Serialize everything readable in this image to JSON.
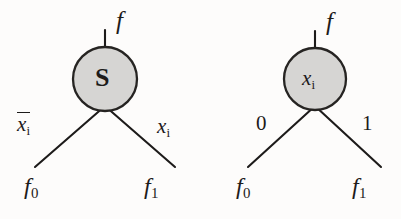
{
  "figure": {
    "background_color": "#fdfcfb",
    "ink_color": "#1d1b1a",
    "node_fill_color": "#d6d5d3",
    "node_stroke_color": "#262422",
    "width": 401,
    "height": 219,
    "diagram_count": 2
  },
  "diagrams": [
    {
      "id": "shannon-node",
      "node": {
        "label": "S",
        "style": "upright-bold-serif",
        "center_x": 105,
        "center_y": 79,
        "radius": 32,
        "fill": "#d6d5d3"
      },
      "root_edge": {
        "label": "f",
        "style": "italic",
        "x1": 105,
        "y1": 30,
        "x2": 105,
        "y2": 47,
        "label_x": 116,
        "label_y": 8
      },
      "branches": [
        {
          "side": "left",
          "edge_label": "x̅i",
          "edge_label_plain": "x_i_bar",
          "edge_label_base": "x",
          "edge_label_sub": "i",
          "overline": true,
          "leaf_label_base": "f",
          "leaf_label_sub": "0",
          "x1": 105,
          "y1": 106,
          "x2": 35,
          "y2": 167,
          "edge_label_x": 17,
          "edge_label_y": 112,
          "leaf_x": 24,
          "leaf_y": 174
        },
        {
          "side": "right",
          "edge_label": "xi",
          "edge_label_plain": "x_i",
          "edge_label_base": "x",
          "edge_label_sub": "i",
          "overline": false,
          "leaf_label_base": "f",
          "leaf_label_sub": "1",
          "x1": 105,
          "y1": 106,
          "x2": 175,
          "y2": 167,
          "edge_label_x": 157,
          "edge_label_y": 116,
          "leaf_x": 144,
          "leaf_y": 174
        }
      ]
    },
    {
      "id": "variable-node",
      "node": {
        "label_base": "x",
        "label_sub": "i",
        "style": "italic-serif",
        "center_x": 315,
        "center_y": 79,
        "radius": 31,
        "fill": "#d6d5d3"
      },
      "root_edge": {
        "label": "f",
        "style": "italic",
        "x1": 315,
        "y1": 31,
        "x2": 315,
        "y2": 48,
        "label_x": 326,
        "label_y": 9
      },
      "branches": [
        {
          "side": "left",
          "edge_label": "0",
          "edge_label_plain": "0",
          "overline": false,
          "leaf_label_base": "f",
          "leaf_label_sub": "0",
          "x1": 315,
          "y1": 106,
          "x2": 248,
          "y2": 167,
          "edge_label_x": 256,
          "edge_label_y": 113,
          "leaf_x": 236,
          "leaf_y": 174
        },
        {
          "side": "right",
          "edge_label": "1",
          "edge_label_plain": "1",
          "overline": false,
          "leaf_label_base": "f",
          "leaf_label_sub": "1",
          "x1": 315,
          "y1": 106,
          "x2": 381,
          "y2": 167,
          "edge_label_x": 362,
          "edge_label_y": 113,
          "leaf_x": 352,
          "leaf_y": 174
        }
      ]
    }
  ]
}
